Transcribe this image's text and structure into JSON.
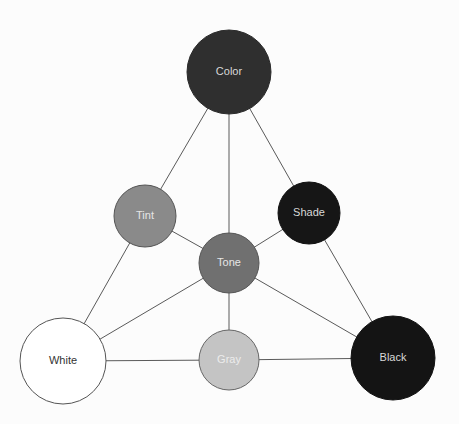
{
  "diagram": {
    "nodes": [
      {
        "id": "color",
        "label": "Color",
        "cx": 229,
        "cy": 72,
        "r": 42,
        "fill": "#2f2f2f",
        "text_color": "#d8d8d8",
        "stroke": "#2a2a2a"
      },
      {
        "id": "tint",
        "label": "Tint",
        "cx": 145,
        "cy": 216,
        "r": 31,
        "fill": "#8a8a8a",
        "text_color": "#e6e6e6",
        "stroke": "#555555"
      },
      {
        "id": "shade",
        "label": "Shade",
        "cx": 309,
        "cy": 213,
        "r": 31,
        "fill": "#161616",
        "text_color": "#d8d8d8",
        "stroke": "#111111"
      },
      {
        "id": "tone",
        "label": "Tone",
        "cx": 229,
        "cy": 263,
        "r": 30,
        "fill": "#707070",
        "text_color": "#e6e6e6",
        "stroke": "#555555"
      },
      {
        "id": "white",
        "label": "White",
        "cx": 63,
        "cy": 361,
        "r": 43,
        "fill": "#ffffff",
        "text_color": "#333333",
        "stroke": "#555555"
      },
      {
        "id": "gray",
        "label": "Gray",
        "cx": 229,
        "cy": 360,
        "r": 30,
        "fill": "#c4c4c4",
        "text_color": "#ececec",
        "stroke": "#666666"
      },
      {
        "id": "black",
        "label": "Black",
        "cx": 393,
        "cy": 358,
        "r": 42,
        "fill": "#141414",
        "text_color": "#d8d8d8",
        "stroke": "#111111"
      }
    ],
    "edges": [
      [
        "color",
        "tint"
      ],
      [
        "color",
        "tone"
      ],
      [
        "color",
        "shade"
      ],
      [
        "tint",
        "white"
      ],
      [
        "tint",
        "tone"
      ],
      [
        "shade",
        "black"
      ],
      [
        "shade",
        "tone"
      ],
      [
        "tone",
        "white"
      ],
      [
        "tone",
        "gray"
      ],
      [
        "tone",
        "black"
      ],
      [
        "white",
        "gray"
      ],
      [
        "gray",
        "black"
      ]
    ],
    "edge_color": "#5a5a5a"
  }
}
